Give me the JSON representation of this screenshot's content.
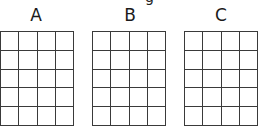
{
  "caption_partial": "g",
  "grids": [
    {
      "label": "A",
      "rows": 5,
      "cols": 4
    },
    {
      "label": "B",
      "rows": 5,
      "cols": 4
    },
    {
      "label": "C",
      "rows": 5,
      "cols": 4
    }
  ],
  "colors": {
    "line": "#3a3a3a",
    "text": "#1a1a1a",
    "background": "#ffffff"
  }
}
